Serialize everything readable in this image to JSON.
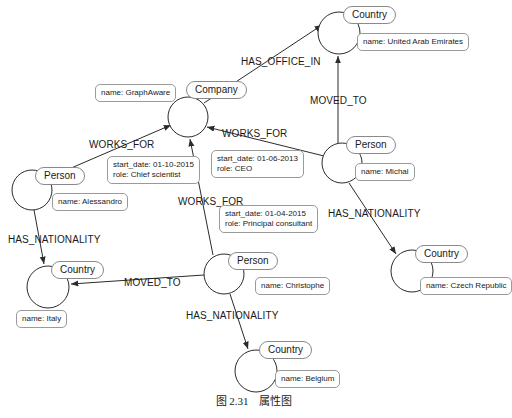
{
  "figure": {
    "caption_number": "图 2.31",
    "caption_title": "属性图"
  },
  "nodes": [
    {
      "id": "country_uae",
      "label": "Country",
      "property": "name: United Arab Emirates",
      "cx": 339,
      "cy": 33,
      "r": 21,
      "label_x": 343,
      "label_y": 6,
      "prop_x": 357,
      "prop_y": 33
    },
    {
      "id": "company_graphaware",
      "label": "Company",
      "property": "name: GraphAware",
      "cx": 188,
      "cy": 117,
      "r": 20,
      "label_x": 186,
      "label_y": 81,
      "prop_x": 95,
      "prop_y": 84
    },
    {
      "id": "person_michal",
      "label": "Person",
      "property": "name: Michal",
      "cx": 342,
      "cy": 163,
      "r": 20,
      "label_x": 346,
      "label_y": 136,
      "prop_x": 355,
      "prop_y": 163
    },
    {
      "id": "person_alessandro",
      "label": "Person",
      "property": "name: Alessandro",
      "cx": 32,
      "cy": 190,
      "r": 20,
      "label_x": 35,
      "label_y": 167,
      "prop_x": 52,
      "prop_y": 193
    },
    {
      "id": "person_christophe",
      "label": "Person",
      "property": "name: Christophe",
      "cx": 224,
      "cy": 274,
      "r": 20,
      "label_x": 228,
      "label_y": 252,
      "prop_x": 255,
      "prop_y": 277
    },
    {
      "id": "country_czech",
      "label": "Country",
      "property": "name: Czech Republic",
      "cx": 412,
      "cy": 271,
      "r": 21,
      "label_x": 415,
      "label_y": 245,
      "prop_x": 420,
      "prop_y": 277
    },
    {
      "id": "country_italy",
      "label": "Country",
      "property": "name: Italy",
      "cx": 48,
      "cy": 287,
      "r": 21,
      "label_x": 51,
      "label_y": 261,
      "prop_x": 16,
      "prop_y": 310
    },
    {
      "id": "country_belgium",
      "label": "Country",
      "property": "name: Belgium",
      "cx": 256,
      "cy": 371,
      "r": 21,
      "label_x": 259,
      "label_y": 341,
      "prop_x": 275,
      "prop_y": 370
    }
  ],
  "relationships": [
    {
      "id": "has_office_in",
      "type": "HAS_OFFICE_IN",
      "from": "company_graphaware",
      "to": "country_uae",
      "label_x": 241,
      "label_y": 56,
      "properties": []
    },
    {
      "id": "moved_to_uae",
      "type": "MOVED_TO",
      "from": "person_michal",
      "to": "country_uae",
      "label_x": 310,
      "label_y": 95,
      "properties": []
    },
    {
      "id": "works_for_alessandro",
      "type": "WORKS_FOR",
      "from": "person_alessandro",
      "to": "company_graphaware",
      "label_x": 89,
      "label_y": 139,
      "properties": [
        "start_date: 01-10-2015",
        "role: Chief scientist"
      ],
      "prop_x": 107,
      "prop_y": 156
    },
    {
      "id": "works_for_michal",
      "type": "WORKS_FOR",
      "from": "person_michal",
      "to": "company_graphaware",
      "label_x": 222,
      "label_y": 128,
      "properties": [
        "start_date: 01-06-2013",
        "role: CEO"
      ],
      "prop_x": 211,
      "prop_y": 150
    },
    {
      "id": "works_for_christophe",
      "type": "WORKS_FOR",
      "from": "person_christophe",
      "to": "company_graphaware",
      "label_x": 178,
      "label_y": 196,
      "properties": [
        "start_date: 01-04-2015",
        "role: Principal consultant"
      ],
      "prop_x": 219,
      "prop_y": 205
    },
    {
      "id": "has_nationality_alessandro",
      "type": "HAS_NATIONALITY",
      "from": "person_alessandro",
      "to": "country_italy",
      "label_x": 8,
      "label_y": 234,
      "properties": []
    },
    {
      "id": "has_nationality_michal",
      "type": "HAS_NATIONALITY",
      "from": "person_michal",
      "to": "country_czech",
      "label_x": 328,
      "label_y": 208,
      "properties": []
    },
    {
      "id": "moved_to_italy",
      "type": "MOVED_TO",
      "from": "person_christophe",
      "to": "country_italy",
      "label_x": 124,
      "label_y": 277,
      "properties": []
    },
    {
      "id": "has_nationality_christophe",
      "type": "HAS_NATIONALITY",
      "from": "person_christophe",
      "to": "country_belgium",
      "label_x": 186,
      "label_y": 310,
      "properties": []
    }
  ],
  "colors": {
    "stroke": "#2b2b2b",
    "pill_border": "#8a8a8a",
    "box_border": "#9a9a9a",
    "background": "#ffffff",
    "text": "#1a1a1a"
  }
}
